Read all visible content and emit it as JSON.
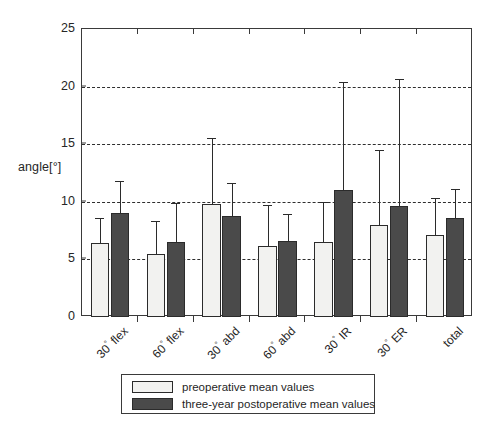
{
  "chart_data": {
    "type": "bar",
    "title": "",
    "subtitle": "",
    "xlabel": "",
    "ylabel": "angle[°]",
    "ylim": [
      0,
      25
    ],
    "yticks": [
      0,
      5,
      10,
      15,
      20,
      25
    ],
    "ytick_labels": [
      "0",
      "5",
      "10",
      "15",
      "20",
      "25"
    ],
    "grid": "horizontal-dashed",
    "legend_position": "bottom-center",
    "categories": [
      "30° flex",
      "60° flex",
      "30° abd",
      "60° abd",
      "30° IR",
      "30° ER",
      "total"
    ],
    "series": [
      {
        "name": "preoperative mean values",
        "color": "#f2f2f0",
        "values": [
          6.4,
          5.5,
          9.8,
          6.2,
          6.5,
          8.0,
          7.1
        ],
        "error_upper": [
          8.6,
          8.3,
          15.5,
          9.7,
          10.0,
          14.5,
          10.3
        ]
      },
      {
        "name": "three-year postoperative mean values",
        "color": "#4a4a4a",
        "values": [
          9.0,
          6.5,
          8.8,
          6.6,
          11.0,
          9.6,
          8.6
        ],
        "error_upper": [
          11.8,
          9.9,
          11.6,
          8.9,
          20.4,
          20.7,
          11.1
        ]
      }
    ]
  },
  "legend": {
    "entries": [
      {
        "label": "preoperative mean values",
        "swatch": "pre"
      },
      {
        "label": "three-year postoperative mean values",
        "swatch": "post"
      }
    ]
  },
  "axis": {
    "y_title": "angle[°]"
  },
  "colors": {
    "preoperative": "#f2f2f0",
    "postoperative": "#4a4a4a",
    "axis": "#3a3a3a",
    "grid": "#2e2e2e",
    "background": "#ffffff"
  }
}
